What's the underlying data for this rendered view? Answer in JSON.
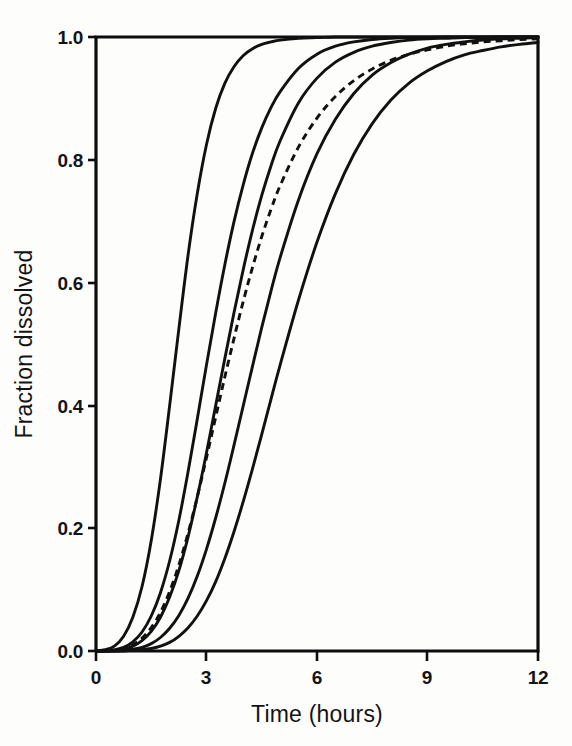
{
  "figure": {
    "background_color": "#fdfdfc",
    "ink_color": "#111111"
  },
  "chart_data": {
    "type": "line",
    "title": "",
    "subtitle": "",
    "xlabel": "Time (hours)",
    "ylabel": "Fraction dissolved",
    "xlim": [
      0,
      12
    ],
    "ylim": [
      0.0,
      1.0
    ],
    "xticks": [
      0,
      3,
      6,
      9,
      12
    ],
    "xtick_labels": [
      "0",
      "3",
      "6",
      "9",
      "12"
    ],
    "yticks": [
      0.0,
      0.2,
      0.4,
      0.6,
      0.8,
      1.0
    ],
    "ytick_labels": [
      "0.0",
      "0.2",
      "0.4",
      "0.6",
      "0.8",
      "1.0"
    ],
    "grid": false,
    "legend": null,
    "legend_position": "none",
    "x": [
      0,
      0.25,
      0.5,
      0.75,
      1,
      1.25,
      1.5,
      1.75,
      2,
      2.25,
      2.5,
      2.75,
      3,
      3.25,
      3.5,
      3.75,
      4,
      4.25,
      4.5,
      4.75,
      5,
      5.5,
      6,
      6.5,
      7,
      7.5,
      8,
      8.5,
      9,
      9.5,
      10,
      10.5,
      11,
      11.5,
      12
    ],
    "series": [
      {
        "name": "curve-1",
        "style": "solid",
        "t50": 2.0,
        "values": [
          0.0,
          0.002,
          0.008,
          0.024,
          0.055,
          0.105,
          0.18,
          0.28,
          0.4,
          0.525,
          0.645,
          0.745,
          0.825,
          0.884,
          0.925,
          0.952,
          0.97,
          0.981,
          0.988,
          0.992,
          0.995,
          0.998,
          0.999,
          1.0,
          1.0,
          1.0,
          1.0,
          1.0,
          1.0,
          1.0,
          1.0,
          1.0,
          1.0,
          1.0,
          1.0
        ]
      },
      {
        "name": "curve-2",
        "style": "solid",
        "t50": 3.1,
        "values": [
          0.0,
          0.0,
          0.002,
          0.006,
          0.015,
          0.031,
          0.057,
          0.095,
          0.147,
          0.213,
          0.292,
          0.378,
          0.466,
          0.551,
          0.63,
          0.7,
          0.76,
          0.811,
          0.852,
          0.885,
          0.911,
          0.949,
          0.972,
          0.985,
          0.992,
          0.996,
          0.998,
          0.999,
          0.999,
          1.0,
          1.0,
          1.0,
          1.0,
          1.0,
          1.0
        ]
      },
      {
        "name": "curve-3",
        "style": "solid",
        "t50": 3.95,
        "values": [
          0.0,
          0.0,
          0.001,
          0.003,
          0.008,
          0.017,
          0.032,
          0.055,
          0.088,
          0.131,
          0.186,
          0.251,
          0.323,
          0.4,
          0.477,
          0.552,
          0.622,
          0.686,
          0.742,
          0.79,
          0.831,
          0.893,
          0.933,
          0.959,
          0.975,
          0.985,
          0.991,
          0.995,
          0.997,
          0.998,
          0.999,
          0.999,
          1.0,
          1.0,
          1.0
        ]
      },
      {
        "name": "curve-dashed",
        "style": "dashed",
        "t50": 3.9,
        "values": [
          0.0,
          0.0,
          0.001,
          0.004,
          0.01,
          0.021,
          0.038,
          0.063,
          0.097,
          0.14,
          0.192,
          0.251,
          0.315,
          0.381,
          0.447,
          0.51,
          0.57,
          0.625,
          0.675,
          0.719,
          0.758,
          0.821,
          0.868,
          0.903,
          0.929,
          0.948,
          0.962,
          0.972,
          0.979,
          0.985,
          0.989,
          0.992,
          0.994,
          0.996,
          0.997
        ]
      },
      {
        "name": "curve-4",
        "style": "solid",
        "t50": 5.05,
        "values": [
          0.0,
          0.0,
          0.0,
          0.001,
          0.003,
          0.006,
          0.012,
          0.022,
          0.037,
          0.058,
          0.086,
          0.122,
          0.166,
          0.217,
          0.274,
          0.336,
          0.4,
          0.464,
          0.527,
          0.586,
          0.641,
          0.735,
          0.81,
          0.866,
          0.908,
          0.938,
          0.958,
          0.972,
          0.982,
          0.988,
          0.992,
          0.995,
          0.997,
          0.998,
          0.999
        ]
      },
      {
        "name": "curve-5",
        "style": "solid",
        "t50": 6.1,
        "values": [
          0.0,
          0.0,
          0.0,
          0.0,
          0.001,
          0.002,
          0.004,
          0.008,
          0.014,
          0.024,
          0.038,
          0.057,
          0.082,
          0.113,
          0.151,
          0.195,
          0.244,
          0.297,
          0.353,
          0.41,
          0.466,
          0.572,
          0.666,
          0.745,
          0.809,
          0.859,
          0.897,
          0.925,
          0.945,
          0.96,
          0.971,
          0.978,
          0.984,
          0.988,
          0.991
        ]
      }
    ]
  }
}
